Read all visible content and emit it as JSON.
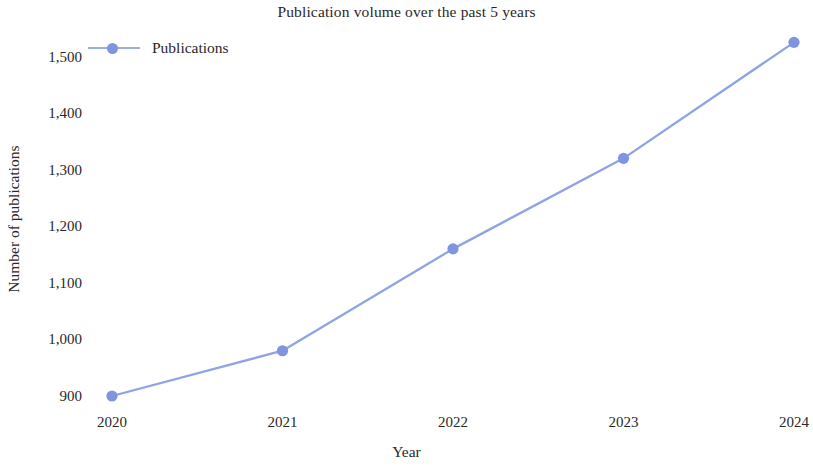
{
  "chart_data": {
    "type": "line",
    "title": "Publication volume over the past 5 years",
    "xlabel": "Year",
    "ylabel": "Number of publications",
    "categories": [
      "2020",
      "2021",
      "2022",
      "2023",
      "2024"
    ],
    "x": [
      2020,
      2021,
      2022,
      2023,
      2024
    ],
    "series": [
      {
        "name": "Publications",
        "values": [
          900,
          980,
          1160,
          1320,
          1525
        ],
        "color": "#8fa3e6",
        "marker": "circle",
        "marker_color": "#7f95e0"
      }
    ],
    "ylim": [
      880,
      1545
    ],
    "yticks": [
      900,
      1000,
      1100,
      1200,
      1300,
      1400,
      1500
    ],
    "ytick_labels": [
      "900",
      "1,000",
      "1,100",
      "1,200",
      "1,300",
      "1,400",
      "1,500"
    ],
    "xtick_labels": [
      "2020",
      "2021",
      "2022",
      "2023",
      "2024"
    ],
    "grid": false,
    "legend": [
      "Publications"
    ],
    "legend_position": "top-left",
    "background": "#ffffff"
  },
  "legend": {
    "entries": [
      {
        "label": "Publications",
        "icon": "line-marker-icon"
      }
    ]
  }
}
